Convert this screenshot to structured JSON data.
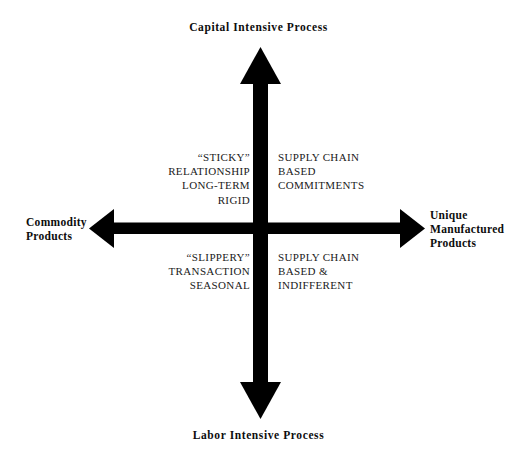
{
  "diagram": {
    "axes": {
      "top": {
        "name": "capital-intensive-process",
        "text": "Capital Intensive Process"
      },
      "bottom": {
        "name": "labor-intensive-process",
        "text": "Labor Intensive Process"
      },
      "left": {
        "name": "commodity-products",
        "text": "Commodity\nProducts"
      },
      "right": {
        "name": "unique-manufactured-products",
        "text": "Unique\nManufactured\nProducts"
      }
    },
    "quadrants": {
      "top_left": {
        "name": "sticky-relationship",
        "text": "“STICKY”\nRELATIONSHIP\nLONG-TERM\nRIGID"
      },
      "top_right": {
        "name": "supply-chain-based-commitments",
        "text": "SUPPLY CHAIN\nBASED\nCOMMITMENTS"
      },
      "bottom_left": {
        "name": "slippery-transaction",
        "text": "“SLIPPERY”\nTRANSACTION\nSEASONAL"
      },
      "bottom_right": {
        "name": "supply-chain-based-indifferent",
        "text": "SUPPLY CHAIN\nBASED &\nINDIFFERENT"
      }
    },
    "colors": {
      "axis": "#000000",
      "text": "#000000",
      "background": "#ffffff"
    }
  }
}
